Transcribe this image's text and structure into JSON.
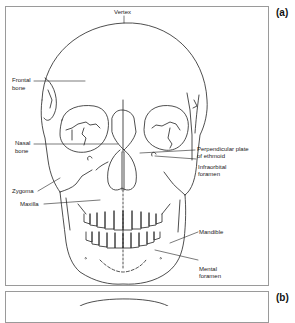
{
  "figure": {
    "panels": [
      {
        "id": "a",
        "label": "(a)"
      },
      {
        "id": "b",
        "label": "(b)"
      }
    ],
    "panel_a": {
      "subject": "skull-anterior-view",
      "labels": {
        "vertex": "Vertex",
        "frontal_bone_1": "Frontal",
        "frontal_bone_2": "bone",
        "nasal_bone_1": "Nasal",
        "nasal_bone_2": "bone",
        "zygoma": "Zygoma",
        "maxilla": "Maxilla",
        "perpendicular_plate_1": "Perpendicular plate",
        "perpendicular_plate_2": "of ethmoid",
        "infraorbital_foramen_1": "Infraorbital",
        "infraorbital_foramen_2": "foramen",
        "mandible": "Mandible",
        "mental_foramen_1": "Mental",
        "mental_foramen_2": "foramen"
      }
    }
  },
  "colors": {
    "line": "#222222",
    "frame": "#9a9a9a",
    "background": "#ffffff"
  }
}
